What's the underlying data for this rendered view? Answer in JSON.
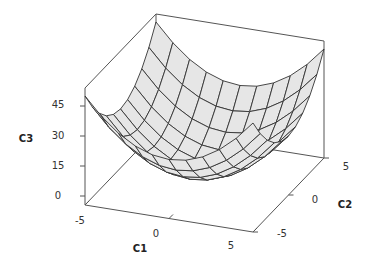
{
  "chart_data": {
    "type": "surface",
    "title": "",
    "function": "C3 = C1^2 + C2^2",
    "x": {
      "label": "C1",
      "ticks": [
        -5,
        0,
        5
      ],
      "range": [
        -5,
        5
      ]
    },
    "y": {
      "label": "C2",
      "ticks": [
        -5,
        0,
        5
      ],
      "range": [
        -5,
        5
      ]
    },
    "z": {
      "label": "C3",
      "ticks": [
        0,
        15,
        30,
        45
      ],
      "range": [
        0,
        57
      ]
    },
    "grid_points": [
      -5,
      -4,
      -3,
      -2,
      -1,
      0,
      1,
      2,
      3,
      4,
      5
    ],
    "surface_fill": "#e6e6e6",
    "wire_color": "#333333",
    "frame_color": "#555555"
  },
  "labels": {
    "x_title": "C1",
    "y_title": "C2",
    "z_title": "C3",
    "x_ticks": [
      "-5",
      "0",
      "5"
    ],
    "y_ticks": [
      "-5",
      "0",
      "5"
    ],
    "z_ticks": [
      "0",
      "15",
      "30",
      "45"
    ]
  }
}
